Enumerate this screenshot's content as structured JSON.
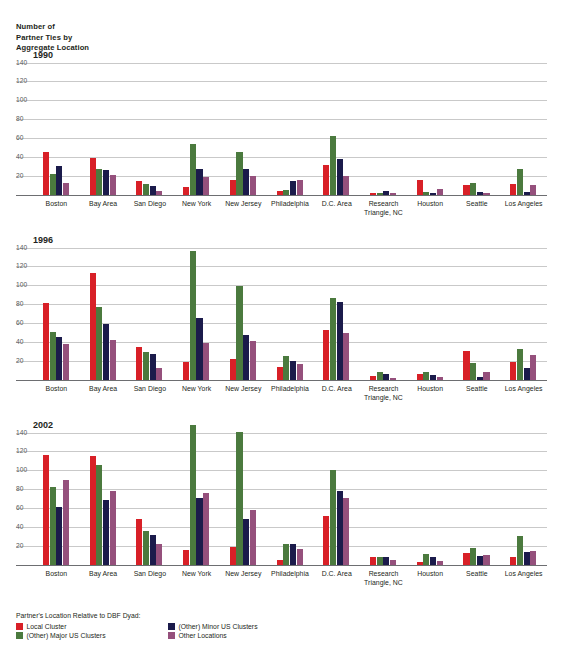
{
  "title_lines": [
    "Number of",
    "Partner Ties by",
    "Aggregate Location"
  ],
  "legend": {
    "title": "Partner's Location Relative to DBF Dyad:",
    "items": [
      {
        "label": "Local Cluster",
        "color": "#d82027"
      },
      {
        "label": "(Other) Minor US Clusters",
        "color": "#1b1b4b"
      },
      {
        "label": "(Other) Major US Clusters",
        "color": "#4b7a3e"
      },
      {
        "label": "Other Locations",
        "color": "#95507c"
      }
    ]
  },
  "axis": {
    "ticks": [
      20,
      40,
      60,
      80,
      100,
      120,
      140
    ],
    "ymin": 0,
    "ymax": 148
  },
  "chart_data": {
    "type": "bar",
    "title": "Number of Partner Ties by Aggregate Location",
    "xlabel": "",
    "ylabel": "Number of Partner Ties",
    "ylim": [
      0,
      148
    ],
    "grid": true,
    "legend_position": "bottom-left",
    "categories": [
      "Boston",
      "Bay Area",
      "San Diego",
      "New York",
      "New Jersey",
      "Philadelphia",
      "D.C. Area",
      "Research Triangle, NC",
      "Houston",
      "Seattle",
      "Los Angeles"
    ],
    "series_names": [
      "Local Cluster",
      "(Other) Major US Clusters",
      "(Other) Minor US Clusters",
      "Other Locations"
    ],
    "series_colors": [
      "#d82027",
      "#4b7a3e",
      "#1b1b4b",
      "#95507c"
    ],
    "panels": [
      {
        "year": "1990",
        "series": [
          {
            "name": "Local Cluster",
            "values": [
              46,
              39,
              15,
              8,
              16,
              4,
              32,
              2,
              16,
              11,
              12
            ]
          },
          {
            "name": "(Other) Major US Clusters",
            "values": [
              22,
              28,
              12,
              54,
              45,
              5,
              62,
              2,
              3,
              13,
              28
            ]
          },
          {
            "name": "(Other) Minor US Clusters",
            "values": [
              31,
              26,
              10,
              27,
              28,
              15,
              38,
              4,
              2,
              3,
              3
            ]
          },
          {
            "name": "Other Locations",
            "values": [
              13,
              21,
              4,
              19,
              20,
              16,
              20,
              2,
              6,
              2,
              11
            ]
          }
        ]
      },
      {
        "year": "1996",
        "series": [
          {
            "name": "Local Cluster",
            "values": [
              81,
              113,
              35,
              19,
              22,
              14,
              53,
              4,
              6,
              31,
              19
            ]
          },
          {
            "name": "(Other) Major US Clusters",
            "values": [
              51,
              77,
              30,
              136,
              99,
              25,
              87,
              8,
              9,
              18,
              33
            ]
          },
          {
            "name": "(Other) Minor US Clusters",
            "values": [
              45,
              59,
              27,
              66,
              48,
              20,
              83,
              6,
              5,
              3,
              13
            ]
          },
          {
            "name": "Other Locations",
            "values": [
              38,
              42,
              13,
              39,
              41,
              17,
              50,
              2,
              3,
              9,
              26
            ]
          }
        ]
      },
      {
        "year": "2002",
        "series": [
          {
            "name": "Local Cluster",
            "values": [
              116,
              115,
              49,
              16,
              19,
              5,
              52,
              8,
              3,
              13,
              8
            ]
          },
          {
            "name": "(Other) Major US Clusters",
            "values": [
              83,
              106,
              36,
              148,
              141,
              22,
              100,
              9,
              12,
              18,
              31
            ]
          },
          {
            "name": "(Other) Minor US Clusters",
            "values": [
              61,
              69,
              32,
              71,
              49,
              22,
              78,
              8,
              9,
              10,
              14
            ]
          },
          {
            "name": "Other Locations",
            "values": [
              90,
              78,
              22,
              76,
              58,
              17,
              71,
              5,
              4,
              11,
              15
            ]
          }
        ]
      }
    ]
  }
}
